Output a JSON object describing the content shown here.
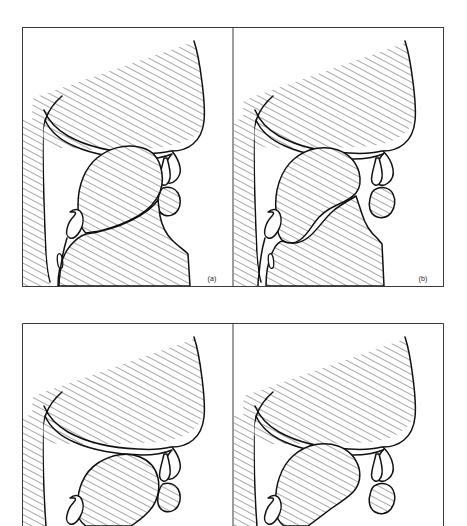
{
  "figure": {
    "domain": "articulatory phonetics diagram",
    "layout": "2 rows x 2 columns of framed line-drawing panels",
    "background_color": "#ffffff",
    "line_color": "#111111",
    "hatch_color": "#4a4a4a",
    "frame_color": "#3a3a3a",
    "frame": {
      "x": 22,
      "y": 27,
      "width": 422,
      "height": 499,
      "divider_x": 233,
      "row_split_top_bottom": 287,
      "row2_top": 323
    },
    "panels": [
      {
        "id": "panel-a",
        "label": "(a)",
        "label_x": 212,
        "label_y": 281,
        "row": 1,
        "column": 1,
        "description": "open vocal tract, low flat tongue, spread lips, velum raised",
        "tongue_position": "low front, flat body",
        "lip_posture": "spread / unrounded",
        "velum": "raised against pharyngeal wall"
      },
      {
        "id": "panel-b",
        "label": "(b)",
        "label_x": 423,
        "label_y": 281,
        "row": 1,
        "column": 2,
        "description": "tongue bunched and retracted, narrowed pharynx, protruded rounded lips",
        "tongue_position": "back / bunched, retracted root",
        "lip_posture": "rounded / protruded",
        "velum": "raised against pharyngeal wall"
      },
      {
        "id": "panel-c",
        "label": "",
        "label_x": 212,
        "label_y": 520,
        "row": 2,
        "column": 1,
        "description": "lowered flat tongue, wide open oral cavity (panel cropped by image edge)",
        "tongue_position": "low, flattened",
        "lip_posture": "open / neutral",
        "velum": "raised"
      },
      {
        "id": "panel-d",
        "label": "",
        "label_x": 423,
        "label_y": 520,
        "row": 2,
        "column": 2,
        "description": "tongue raised and retracted toward velum (panel cropped by image edge)",
        "tongue_position": "back, raised dorsum",
        "lip_posture": "slightly rounded",
        "velum": "raised"
      }
    ],
    "hatching": {
      "style": "diagonal parallel lines",
      "angle_degrees": 62,
      "spacing_px": 2.6,
      "stroke_width": 0.55,
      "meaning": "solid tissue (head, tongue body, lips, jaw) outside the airway"
    },
    "anatomical_features": [
      "nasal cavity outline",
      "hard palate",
      "soft palate (velum)",
      "uvula",
      "upper lip",
      "lower lip",
      "tongue body",
      "tongue root",
      "epiglottis",
      "pharyngeal wall",
      "vocal folds",
      "jaw"
    ]
  }
}
